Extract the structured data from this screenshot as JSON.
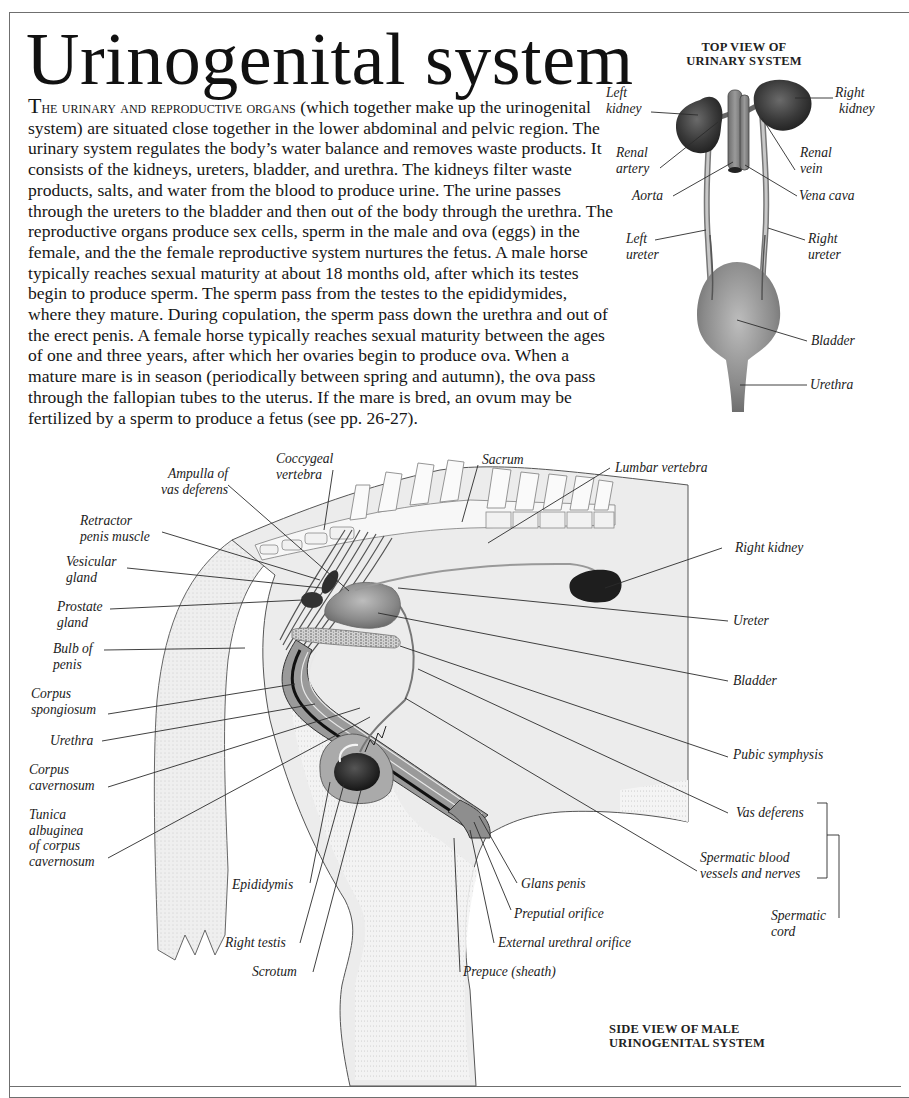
{
  "page": {
    "title": "Urinogenital system",
    "intro": {
      "lead_cap": "T",
      "lead_smallcaps": "HE URINARY AND REPRODUCTIVE ORGANS",
      "body": " (which together make up the urinogenital system) are situated close together in the lower abdominal and pelvic region. The urinary system regulates the body’s water balance and removes waste products. It consists of the kidneys, ureters, bladder, and urethra. The kidneys filter waste products, salts, and water from the blood to produce urine. The urine passes through the ureters to the bladder and then out of the body through the urethra. The reproductive organs produce sex cells, sperm in the male and ova (eggs) in the female, and the the female reproductive system nurtures the fetus. A male horse typically reaches sexual maturity at about 18 months old, after which its testes begin to produce sperm. The sperm pass from the testes to the epididymides, where they mature. During copulation, the sperm pass down the urethra and out of the erect penis. A female horse typically reaches sexual maturity between the ages of one and three years, after which her ovaries begin to produce ova. When a mature mare is in season (periodically between spring and autumn), the ova pass through the fallopian tubes to the uterus. If the mare is bred, an ovum may be fertilized by a sperm to produce a fetus (see pp. 26-27)."
    }
  },
  "top_view": {
    "title_line1": "TOP VIEW OF",
    "title_line2": "URINARY SYSTEM",
    "labels": {
      "left_kidney": [
        "Left",
        "kidney"
      ],
      "right_kidney": [
        "Right",
        "kidney"
      ],
      "renal_artery": [
        "Renal",
        "artery"
      ],
      "renal_vein": [
        "Renal",
        "vein"
      ],
      "aorta": "Aorta",
      "vena_cava": "Vena cava",
      "left_ureter": [
        "Left",
        "ureter"
      ],
      "right_ureter": [
        "Right",
        "ureter"
      ],
      "bladder": "Bladder",
      "urethra": "Urethra"
    }
  },
  "side_view": {
    "title_line1": "SIDE VIEW OF MALE",
    "title_line2": "URINOGENITAL SYSTEM",
    "labels": {
      "ampulla": [
        "Ampulla of",
        "vas deferens"
      ],
      "coccygeal": [
        "Coccygeal",
        "vertebra"
      ],
      "sacrum": "Sacrum",
      "lumbar": "Lumbar vertebra",
      "retractor": [
        "Retractor",
        "penis muscle"
      ],
      "vesicular": [
        "Vesicular",
        "gland"
      ],
      "prostate": [
        "Prostate",
        "gland"
      ],
      "bulb": [
        "Bulb of",
        "penis"
      ],
      "corpus_spongiosum": [
        "Corpus",
        "spongiosum"
      ],
      "urethra": "Urethra",
      "corpus_cavernosum": [
        "Corpus",
        "cavernosum"
      ],
      "tunica": [
        "Tunica",
        "albuginea",
        "of corpus",
        "cavernosum"
      ],
      "right_kidney": "Right kidney",
      "ureter": "Ureter",
      "bladder": "Bladder",
      "pubic_symphysis": "Pubic symphysis",
      "vas_deferens": "Vas deferens",
      "spermatic_vessels": [
        "Spermatic blood",
        "vessels and nerves"
      ],
      "spermatic_cord": [
        "Spermatic",
        "cord"
      ],
      "epididymis": "Epididymis",
      "right_testis": "Right testis",
      "scrotum": "Scrotum",
      "glans_penis": "Glans penis",
      "preputial_orifice": "Preputial orifice",
      "external_urethral_orifice": "External urethral orifice",
      "prepuce": "Prepuce (sheath)"
    }
  },
  "colors": {
    "organ_dark": "#2a2a2a",
    "tissue_gray": "#9a9a9a",
    "body_fill": "#ececec",
    "line": "#2b2b2b"
  }
}
